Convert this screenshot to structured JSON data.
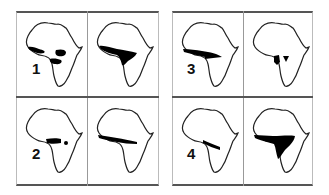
{
  "figure": {
    "panels": [
      {
        "number": "1",
        "maps": [
          "map-1a",
          "map-1b"
        ]
      },
      {
        "number": "2",
        "maps": [
          "map-2a",
          "map-2b"
        ]
      },
      {
        "number": "3",
        "maps": [
          "map-3a",
          "map-3b"
        ]
      },
      {
        "number": "4",
        "maps": [
          "map-4a",
          "map-4b"
        ]
      }
    ],
    "colors": {
      "outline": "#222222",
      "fill": "#000000",
      "frame": "#555555"
    }
  }
}
